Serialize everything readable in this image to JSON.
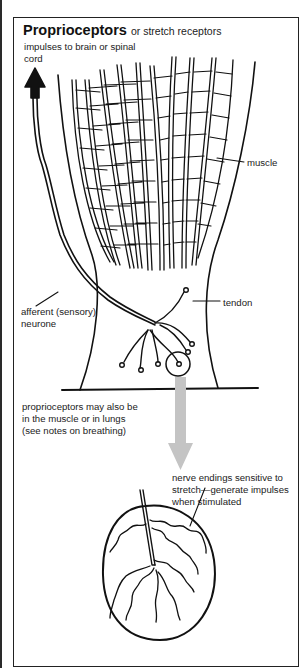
{
  "title": {
    "main": "Proprioceptors",
    "subtitle": "or stretch receptors"
  },
  "labels": {
    "impulses": "impulses to brain or spinal",
    "impulses_line2": "cord",
    "muscle": "muscle",
    "tendon": "tendon",
    "afferent": "afferent (sensory)",
    "afferent_line2": "neurone",
    "note_line1": "proprioceptors may also be",
    "note_line2": "in the muscle or in lungs",
    "note_line3": "(see notes on breathing)",
    "endings_line1": "nerve endings sensitive to",
    "endings_line2": "stretch—generate impulses",
    "endings_line3": "when stimulated"
  },
  "colors": {
    "ink": "#111111",
    "arrow_grey": "#c4c4c4",
    "background": "#ffffff"
  }
}
